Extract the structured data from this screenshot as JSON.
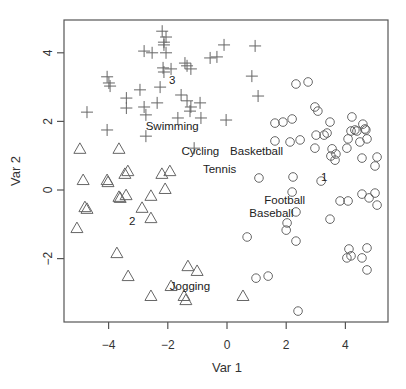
{
  "chart_data": {
    "type": "scatter",
    "title": "",
    "xlabel": "Var 1",
    "ylabel": "Var 2",
    "xlim": [
      -5.4,
      5.5
    ],
    "ylim": [
      -3.8,
      4.9
    ],
    "xticks": [
      -4,
      -2,
      0,
      2,
      4
    ],
    "yticks": [
      -2,
      0,
      2,
      4
    ],
    "xtick_labels": [
      "−4",
      "−2",
      "0",
      "2",
      "4"
    ],
    "ytick_labels": [
      "−2",
      "0",
      "2",
      "4"
    ],
    "grid": false,
    "legend": null,
    "series": [
      {
        "name": "cluster 3",
        "marker": "plus",
        "points": [
          [
            -2.19,
            4.63
          ],
          [
            -2.06,
            4.46
          ],
          [
            -2.13,
            4.31
          ],
          [
            -2.13,
            4.23
          ],
          [
            -2.06,
            4.0
          ],
          [
            -2.8,
            4.05
          ],
          [
            -2.53,
            4.0
          ],
          [
            -2.16,
            3.56
          ],
          [
            -2.13,
            3.44
          ],
          [
            -1.89,
            3.53
          ],
          [
            -1.42,
            3.7
          ],
          [
            -1.35,
            3.62
          ],
          [
            -1.22,
            3.53
          ],
          [
            -0.57,
            3.85
          ],
          [
            -0.34,
            3.88
          ],
          [
            -0.1,
            4.23
          ],
          [
            0.95,
            4.2
          ],
          [
            0.84,
            3.32
          ],
          [
            1.05,
            2.74
          ],
          [
            -4.05,
            3.3
          ],
          [
            -3.99,
            3.12
          ],
          [
            -3.95,
            3.03
          ],
          [
            -2.94,
            2.92
          ],
          [
            -2.26,
            3.0
          ],
          [
            -1.55,
            2.77
          ],
          [
            -3.4,
            2.68
          ],
          [
            -3.4,
            2.39
          ],
          [
            -2.8,
            2.42
          ],
          [
            -2.74,
            2.19
          ],
          [
            -2.36,
            2.54
          ],
          [
            -1.35,
            2.6
          ],
          [
            -0.91,
            2.54
          ],
          [
            -1.22,
            2.42
          ],
          [
            -1.25,
            2.3
          ],
          [
            -0.88,
            2.1
          ],
          [
            -4.73,
            2.27
          ],
          [
            -1.66,
            2.1
          ],
          [
            -4.05,
            1.75
          ],
          [
            -2.74,
            1.57
          ],
          [
            -0.03,
            2.04
          ],
          [
            -1.11,
            1.22
          ]
        ]
      },
      {
        "name": "cluster 2",
        "marker": "triangle",
        "points": [
          [
            -4.97,
            1.2
          ],
          [
            -3.65,
            1.2
          ],
          [
            -4.86,
            0.29
          ],
          [
            -4.05,
            0.29
          ],
          [
            -4.02,
            0.23
          ],
          [
            -3.45,
            0.47
          ],
          [
            -3.35,
            0.55
          ],
          [
            -2.2,
            0.47
          ],
          [
            -1.93,
            0.55
          ],
          [
            -3.65,
            -0.2
          ],
          [
            -3.61,
            -0.23
          ],
          [
            -3.41,
            -0.15
          ],
          [
            -2.57,
            -0.17
          ],
          [
            -2.09,
            0.03
          ],
          [
            -4.8,
            -0.5
          ],
          [
            -4.73,
            -0.55
          ],
          [
            -2.87,
            -0.52
          ],
          [
            -2.57,
            -0.82
          ],
          [
            -5.07,
            -1.11
          ],
          [
            -3.72,
            -1.84
          ],
          [
            -3.34,
            -2.51
          ],
          [
            -1.32,
            -2.22
          ],
          [
            -1.01,
            -2.36
          ],
          [
            -2.57,
            -3.09
          ],
          [
            -1.45,
            -3.09
          ],
          [
            -1.39,
            -3.21
          ],
          [
            0.54,
            -3.09
          ],
          [
            -1.89,
            -2.8
          ]
        ]
      },
      {
        "name": "cluster 1",
        "marker": "circle",
        "points": [
          [
            2.33,
            3.09
          ],
          [
            2.74,
            3.15
          ],
          [
            2.97,
            2.42
          ],
          [
            3.07,
            2.3
          ],
          [
            1.62,
            1.95
          ],
          [
            1.89,
            1.98
          ],
          [
            2.2,
            2.07
          ],
          [
            3.48,
            1.98
          ],
          [
            4.22,
            2.13
          ],
          [
            4.59,
            1.92
          ],
          [
            4.66,
            1.78
          ],
          [
            4.19,
            1.72
          ],
          [
            4.32,
            1.75
          ],
          [
            4.39,
            1.72
          ],
          [
            4.69,
            1.75
          ],
          [
            3.01,
            1.6
          ],
          [
            3.28,
            1.6
          ],
          [
            3.38,
            1.66
          ],
          [
            1.62,
            1.43
          ],
          [
            2.13,
            1.4
          ],
          [
            2.47,
            1.46
          ],
          [
            4.09,
            1.49
          ],
          [
            4.49,
            1.4
          ],
          [
            4.73,
            1.49
          ],
          [
            2.97,
            1.22
          ],
          [
            4.05,
            1.22
          ],
          [
            3.55,
            1.2
          ],
          [
            3.51,
            0.99
          ],
          [
            3.68,
            1.05
          ],
          [
            3.65,
            0.87
          ],
          [
            4.56,
            0.93
          ],
          [
            5.07,
            0.96
          ],
          [
            5.0,
            0.7
          ],
          [
            1.08,
            0.35
          ],
          [
            2.23,
            0.38
          ],
          [
            3.18,
            0.26
          ],
          [
            2.2,
            -0.06
          ],
          [
            4.56,
            -0.12
          ],
          [
            5.0,
            -0.09
          ],
          [
            3.82,
            -0.32
          ],
          [
            4.09,
            -0.32
          ],
          [
            4.8,
            -0.23
          ],
          [
            5.07,
            -0.44
          ],
          [
            2.33,
            -0.64
          ],
          [
            3.48,
            -0.85
          ],
          [
            2.03,
            -0.96
          ],
          [
            2.0,
            -1.17
          ],
          [
            2.33,
            -1.49
          ],
          [
            0.68,
            -1.37
          ],
          [
            4.12,
            -1.72
          ],
          [
            4.19,
            -1.92
          ],
          [
            4.05,
            -1.98
          ],
          [
            4.56,
            -1.98
          ],
          [
            4.73,
            -1.69
          ],
          [
            4.73,
            -2.33
          ],
          [
            0.98,
            -2.57
          ],
          [
            1.39,
            -2.51
          ],
          [
            2.4,
            -3.53
          ]
        ]
      }
    ],
    "annotations": [
      {
        "text": "Swimming",
        "x": -1.85,
        "y": 1.86
      },
      {
        "text": "Cycling",
        "x": -0.9,
        "y": 1.15
      },
      {
        "text": "Basketball",
        "x": 1.0,
        "y": 1.15
      },
      {
        "text": "Tennis",
        "x": -0.25,
        "y": 0.6
      },
      {
        "text": "Football",
        "x": 1.95,
        "y": -0.3
      },
      {
        "text": "Baseball",
        "x": 1.5,
        "y": -0.66
      },
      {
        "text": "Jogging",
        "x": -1.25,
        "y": -2.8
      },
      {
        "text": "1",
        "x": 3.28,
        "y": 0.38
      },
      {
        "text": "2",
        "x": -3.2,
        "y": -0.9
      },
      {
        "text": "3",
        "x": -1.85,
        "y": 3.22
      }
    ]
  },
  "labels": {
    "xlabel": "Var 1",
    "ylabel": "Var 2"
  }
}
